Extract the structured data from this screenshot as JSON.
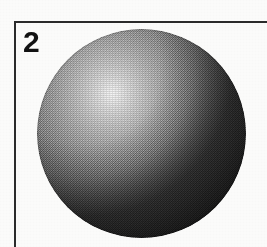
{
  "figure": {
    "panel_label": "2",
    "caption": "",
    "background_color": "#fbfbfa",
    "frame": {
      "color": "#2b2b2b",
      "sides_visible": "top-and-left",
      "thickness_px": 2
    },
    "subject": {
      "name": "shaded-sphere",
      "shape": "sphere",
      "rendering": "halftone-scan",
      "highlight_color": "#f4f4f4",
      "midtone_color": "#7a7a7a",
      "shadow_color": "#121212",
      "highlight_position": "upper-left",
      "light_direction": "from upper-left",
      "center_x": 141,
      "center_y": 133,
      "radius": 104
    }
  }
}
